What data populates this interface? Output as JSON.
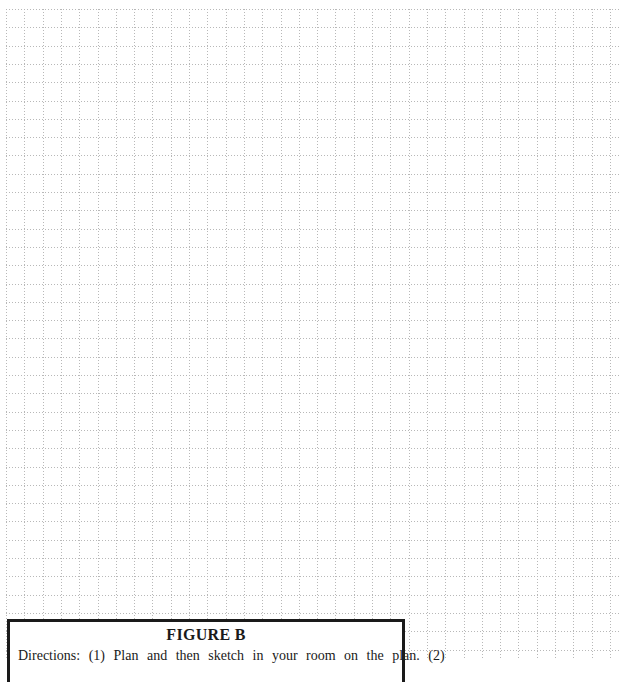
{
  "grid": {
    "cell_size_px": 18.3,
    "columns": 33,
    "rows": 35,
    "line_color": "#b8b8b8",
    "line_style": "dotted"
  },
  "caption": {
    "title": "FIGURE B",
    "text": "Directions: (1) Plan and then sketch in your room on the plan. (2)"
  }
}
